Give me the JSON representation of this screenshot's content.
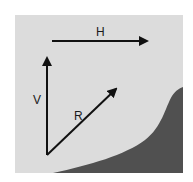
{
  "diagram": {
    "title": "",
    "colors": {
      "background": "#ffffff",
      "panel": "#dcdcdc",
      "terrain": "#505050",
      "arrow": "#111111"
    },
    "vectors": [
      {
        "id": "H",
        "label": "H",
        "description": "horizontal vector pointing right"
      },
      {
        "id": "V",
        "label": "V",
        "description": "vertical vector pointing up"
      },
      {
        "id": "R",
        "label": "R",
        "description": "resultant vector pointing up-right"
      }
    ],
    "regions": [
      {
        "id": "terrain",
        "description": "dark curved slope in lower right"
      }
    ]
  }
}
